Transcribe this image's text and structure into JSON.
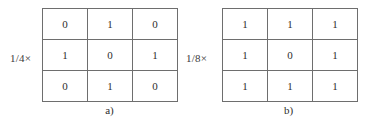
{
  "figure": {
    "background_color": "#ffffff",
    "border_color": "#6e6e6e",
    "text_color": "#2e2e2e",
    "groups": [
      {
        "id": "a",
        "scale_label": "1/4×",
        "caption": "a)",
        "matrix": [
          [
            "0",
            "1",
            "0"
          ],
          [
            "1",
            "0",
            "1"
          ],
          [
            "0",
            "1",
            "0"
          ]
        ]
      },
      {
        "id": "b",
        "scale_label": "1/8×",
        "caption": "b)",
        "matrix": [
          [
            "1",
            "1",
            "1"
          ],
          [
            "1",
            "0",
            "1"
          ],
          [
            "1",
            "1",
            "1"
          ]
        ]
      }
    ]
  },
  "chart_data": {
    "type": "table",
    "title": "",
    "panels": [
      {
        "label": "a)",
        "scale_factor": "1/4×",
        "rows": 3,
        "cols": 3,
        "values": [
          [
            0,
            1,
            0
          ],
          [
            1,
            0,
            1
          ],
          [
            0,
            1,
            0
          ]
        ]
      },
      {
        "label": "b)",
        "scale_factor": "1/8×",
        "rows": 3,
        "cols": 3,
        "values": [
          [
            1,
            1,
            1
          ],
          [
            1,
            0,
            1
          ],
          [
            1,
            1,
            1
          ]
        ]
      }
    ]
  }
}
